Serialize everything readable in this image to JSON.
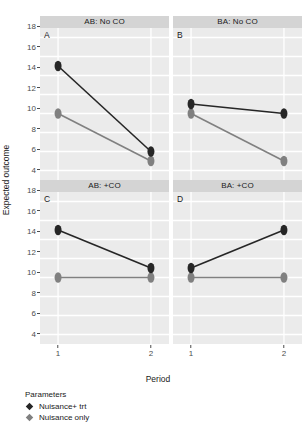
{
  "chart_data": {
    "type": "line",
    "title": "",
    "xlabel": "Period",
    "ylabel": "Expected outcome",
    "x": [
      1,
      2
    ],
    "xticklabels": [
      "1",
      "2"
    ],
    "yticks": [
      4,
      6,
      8,
      10,
      12,
      14,
      16,
      18
    ],
    "ylim": [
      3,
      19
    ],
    "grid": true,
    "legend_position": "bottom-left",
    "legend_title": "Parameters",
    "series_colors": {
      "nuisance_trt": "#262626",
      "nuisance_only": "#808080"
    },
    "panel_background": "#ebebeb",
    "gridline_color": "#ffffff",
    "strip_background": "#d4d4d4",
    "facets": [
      {
        "strip": "AB: No CO",
        "tag": "A",
        "series": [
          {
            "name": "Nuisance+ trt",
            "values": [
              15.0,
              6.0
            ]
          },
          {
            "name": "Nuisance only",
            "values": [
              10.0,
              5.0
            ]
          }
        ]
      },
      {
        "strip": "BA: No CO",
        "tag": "B",
        "series": [
          {
            "name": "Nuisance+ trt",
            "values": [
              11.0,
              10.0
            ]
          },
          {
            "name": "Nuisance only",
            "values": [
              10.0,
              5.0
            ]
          }
        ]
      },
      {
        "strip": "AB: +CO",
        "tag": "C",
        "series": [
          {
            "name": "Nuisance+ trt",
            "values": [
              15.0,
              11.0
            ]
          },
          {
            "name": "Nuisance only",
            "values": [
              10.0,
              10.0
            ]
          }
        ]
      },
      {
        "strip": "BA: +CO",
        "tag": "D",
        "series": [
          {
            "name": "Nuisance+ trt",
            "values": [
              11.0,
              15.0
            ]
          },
          {
            "name": "Nuisance only",
            "values": [
              10.0,
              10.0
            ]
          }
        ]
      }
    ],
    "legend_entries": [
      {
        "label": "Nuisance+ trt",
        "color": "#262626"
      },
      {
        "label": "Nuisance only",
        "color": "#808080"
      }
    ]
  }
}
